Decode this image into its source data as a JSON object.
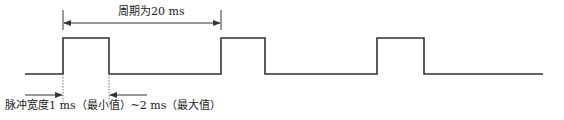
{
  "diagram": {
    "period_label": "周期为20 ms",
    "pulse_width_label": "脉冲宽度1 ms（最小值）~2 ms（最大值）",
    "colors": {
      "line": "#333333",
      "background": "#ffffff"
    },
    "waveform": {
      "baseline_y": 74,
      "high_y": 38,
      "start_x": 25,
      "end_x": 543,
      "pulses": [
        {
          "rise_x": 63,
          "fall_x": 109
        },
        {
          "rise_x": 221,
          "fall_x": 265
        },
        {
          "rise_x": 377,
          "fall_x": 424
        }
      ]
    },
    "period_marker": {
      "left_x": 63,
      "right_x": 221,
      "y": 23,
      "value": "20 ms"
    },
    "pulse_width_marker": {
      "left_x": 63,
      "right_x": 109,
      "y": 95,
      "min": "1 ms",
      "max": "2 ms"
    }
  }
}
